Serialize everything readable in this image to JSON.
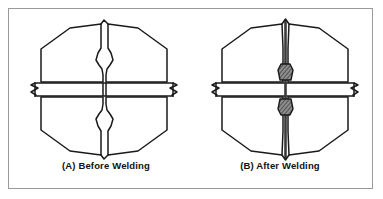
{
  "figure": {
    "border_color": "#9a9a9a",
    "background_color": "#ffffff",
    "line_color": "#1a1a1a",
    "weld_bead_color": "#5a5a5a"
  },
  "panels": [
    {
      "id": "panel-a",
      "label": "(A) Before Welding",
      "state": "before",
      "description": "Two hexagonal member halves separated by an open single-V groove, intersecting a horizontal plate shown with break lines at both ends."
    },
    {
      "id": "panel-b",
      "label": "(B) After Welding",
      "state": "after",
      "description": "The two halves joined along a closed seam, with shaded weld beads deposited above and below the horizontal plate."
    }
  ],
  "components": {
    "member_half_left": "member-half-left",
    "member_half_right": "member-half-right",
    "horizontal_plate": "horizontal-plate",
    "groove_gap": "groove-gap",
    "weld_seam": "weld-seam",
    "weld_bead_top": "weld-bead-top",
    "weld_bead_bottom": "weld-bead-bottom",
    "break_line_left": "break-line-left",
    "break_line_right": "break-line-right"
  }
}
